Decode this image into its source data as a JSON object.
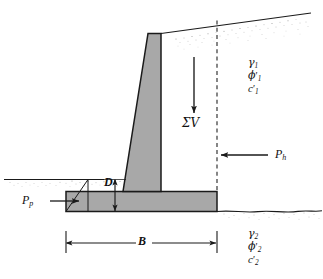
{
  "figure": {
    "type": "retaining-wall-stability-diagram",
    "background_color": "#ffffff",
    "line_color": "#1a1a1a",
    "concrete_fill": "#a8a8a8",
    "stipple_color": "#9a9a9a"
  },
  "labels": {
    "sum_v": "ΣV",
    "p_h": "P",
    "p_h_sub": "h",
    "p_p": "P",
    "p_p_sub": "p",
    "depth": "D",
    "width": "B"
  },
  "soil_upper": {
    "unit_weight": "γ",
    "unit_weight_sub": "1",
    "friction_angle": "ϕ",
    "friction_angle_prime": "′",
    "friction_angle_sub": "1",
    "cohesion": "c",
    "cohesion_prime": "′",
    "cohesion_sub": "1"
  },
  "soil_lower": {
    "unit_weight": "γ",
    "unit_weight_sub": "2",
    "friction_angle": "ϕ",
    "friction_angle_prime": "′",
    "friction_angle_sub": "2",
    "cohesion": "c",
    "cohesion_prime": "′",
    "cohesion_sub": "2"
  }
}
